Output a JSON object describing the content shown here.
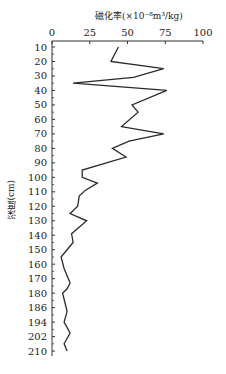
{
  "chart_data": {
    "type": "line",
    "title": "磁化率(×10⁻⁸m³/kg)",
    "xlabel": "磁化率(×10⁻⁸m³/kg)",
    "ylabel": "深度(cm)",
    "x_axis_position": "top",
    "xlim": [
      0,
      100
    ],
    "x_ticks": [
      0,
      25,
      50,
      75,
      100
    ],
    "y_ticks": [
      10,
      20,
      30,
      40,
      50,
      60,
      70,
      80,
      90,
      100,
      110,
      120,
      130,
      140,
      150,
      160,
      170,
      180,
      186,
      194,
      202,
      210
    ],
    "y_inverted": true,
    "grid": false,
    "legend": null,
    "series": [
      {
        "name": "磁化率",
        "points": [
          {
            "depth": 10,
            "value": 44
          },
          {
            "depth": 20,
            "value": 39
          },
          {
            "depth": 25,
            "value": 74
          },
          {
            "depth": 31,
            "value": 54
          },
          {
            "depth": 35,
            "value": 14
          },
          {
            "depth": 40,
            "value": 76
          },
          {
            "depth": 50,
            "value": 53
          },
          {
            "depth": 55,
            "value": 57
          },
          {
            "depth": 65,
            "value": 46
          },
          {
            "depth": 70,
            "value": 74
          },
          {
            "depth": 75,
            "value": 51
          },
          {
            "depth": 80,
            "value": 40
          },
          {
            "depth": 86,
            "value": 49
          },
          {
            "depth": 95,
            "value": 20
          },
          {
            "depth": 100,
            "value": 20
          },
          {
            "depth": 104,
            "value": 30
          },
          {
            "depth": 109,
            "value": 22
          },
          {
            "depth": 113,
            "value": 18
          },
          {
            "depth": 120,
            "value": 17
          },
          {
            "depth": 125,
            "value": 12
          },
          {
            "depth": 130,
            "value": 23
          },
          {
            "depth": 139,
            "value": 13
          },
          {
            "depth": 145,
            "value": 14
          },
          {
            "depth": 155,
            "value": 6
          },
          {
            "depth": 163,
            "value": 8
          },
          {
            "depth": 173,
            "value": 12
          },
          {
            "depth": 177,
            "value": 10
          },
          {
            "depth": 180,
            "value": 7
          },
          {
            "depth": 188,
            "value": 10
          },
          {
            "depth": 194,
            "value": 8
          },
          {
            "depth": 200,
            "value": 12
          },
          {
            "depth": 206,
            "value": 8
          },
          {
            "depth": 210,
            "value": 10
          }
        ]
      }
    ]
  }
}
